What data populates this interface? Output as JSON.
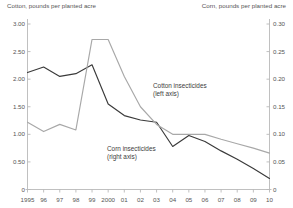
{
  "header": {
    "left_axis_title": "Cotton, pounds per planted acre",
    "right_axis_title": "Corn, pounds per planted acre"
  },
  "annotations": {
    "cotton_line1": "Cotton insecticides",
    "cotton_line2": "(left axis)",
    "corn_line1": "Corn insecticides",
    "corn_line2": "(right axis)"
  },
  "colors": {
    "cotton_line": "#3a3a3a",
    "corn_line": "#a8a8a8",
    "axis": "#b9b9b9",
    "text": "#555555"
  },
  "chart_data": {
    "type": "line",
    "title": "",
    "xlabel": "",
    "ylabel": "Cotton, pounds per planted acre",
    "y2label": "Corn, pounds per planted acre",
    "grid": false,
    "legend": "inline-annotations",
    "x": [
      "1995",
      "96",
      "97",
      "98",
      "99",
      "2000",
      "01",
      "02",
      "03",
      "04",
      "05",
      "06",
      "07",
      "08",
      "09",
      "10"
    ],
    "x_full": [
      1995,
      1996,
      1997,
      1998,
      1999,
      2000,
      2001,
      2002,
      2003,
      2004,
      2005,
      2006,
      2007,
      2008,
      2009,
      2010
    ],
    "ylim": [
      0,
      3.0
    ],
    "yticks": [
      "0",
      "0.50",
      "1.00",
      "1.50",
      "2.00",
      "2.50",
      "3.00"
    ],
    "ytick_values": [
      0,
      0.5,
      1.0,
      1.5,
      2.0,
      2.5,
      3.0
    ],
    "y2lim": [
      0,
      0.3
    ],
    "y2ticks": [
      "0",
      "0.05",
      "0.10",
      "0.15",
      "0.20",
      "0.25",
      "0.30"
    ],
    "y2tick_values": [
      0,
      0.05,
      0.1,
      0.15,
      0.2,
      0.25,
      0.3
    ],
    "series": [
      {
        "name": "Cotton insecticides",
        "axis": "left",
        "color": "#3a3a3a",
        "values": [
          2.12,
          2.22,
          2.05,
          2.1,
          2.26,
          1.55,
          1.34,
          1.26,
          1.22,
          0.78,
          0.98,
          0.87,
          0.7,
          0.55,
          0.38,
          0.2
        ]
      },
      {
        "name": "Corn insecticides",
        "axis": "right",
        "color": "#a8a8a8",
        "values": [
          0.122,
          0.105,
          0.118,
          0.108,
          0.272,
          0.272,
          0.205,
          0.15,
          0.118,
          0.1,
          0.1,
          0.1,
          0.091,
          0.083,
          0.075,
          0.066
        ]
      }
    ]
  }
}
